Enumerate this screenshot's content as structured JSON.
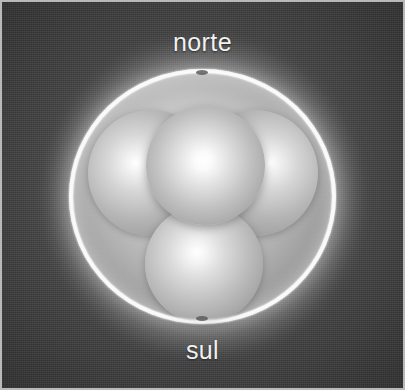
{
  "figure": {
    "title": "",
    "type": "sphere-packing-diagram",
    "labels": {
      "north": "norte",
      "south": "sul"
    },
    "colors": {
      "background": "#3e3e3e",
      "frame_border": "#b9b9b9",
      "shell_rim": "#fcfcfc",
      "shell_fill": "#c4c4c4",
      "sphere_highlight": "#ffffff",
      "sphere_shadow": "#8e8e8e",
      "label_text": "#f1f1f1",
      "pole_mark": "#5c5c5c"
    },
    "outer_shell": {
      "name": "translucent outer sphere",
      "pole_marks": [
        "north-pole-mark",
        "south-pole-mark"
      ]
    },
    "inner_spheres": [
      {
        "id": "lobe-left",
        "name": "left rear sphere"
      },
      {
        "id": "lobe-right",
        "name": "right rear sphere"
      },
      {
        "id": "lobe-center",
        "name": "central front sphere"
      },
      {
        "id": "lobe-bottom",
        "name": "bottom sphere"
      }
    ]
  }
}
